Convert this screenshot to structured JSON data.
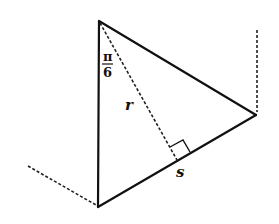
{
  "diagram": {
    "labels": {
      "angle_numerator": "π",
      "angle_denominator": "6",
      "altitude": "r",
      "side": "s"
    },
    "colors": {
      "line": "#111111",
      "background": "#ffffff"
    }
  }
}
